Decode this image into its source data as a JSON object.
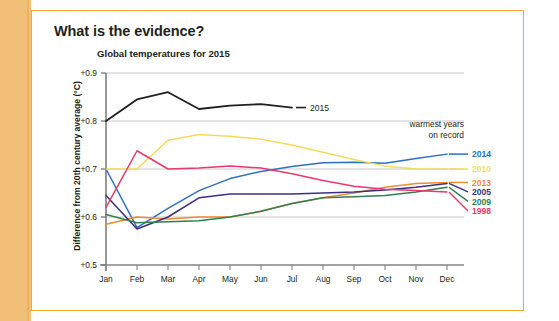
{
  "heading": "What is the evidence?",
  "chart_data": {
    "type": "line",
    "title": "Global temperatures for 2015",
    "xlabel": "",
    "ylabel": "Difference from 20th century average (°C)",
    "categories": [
      "Jan",
      "Feb",
      "Mar",
      "Apr",
      "May",
      "Jun",
      "Jul",
      "Aug",
      "Sep",
      "Oct",
      "Nov",
      "Dec"
    ],
    "ylim": [
      0.5,
      0.9
    ],
    "ytick_labels": [
      "+0.5",
      "+0.6",
      "+0.7",
      "+0.8",
      "+0.9"
    ],
    "ytick_values": [
      0.5,
      0.6,
      0.7,
      0.8,
      0.9
    ],
    "grid": "horizontal",
    "legend_position": "right",
    "legend_title_line1": "warmest years",
    "legend_title_line2": "on record",
    "annotation_2015": "2015",
    "series": [
      {
        "name": "2015",
        "color": "#231f20",
        "label": "2015",
        "in_legend": false,
        "values": [
          0.8,
          0.845,
          0.86,
          0.825,
          0.832,
          0.835,
          0.828,
          null,
          null,
          null,
          null,
          null
        ]
      },
      {
        "name": "2014",
        "color": "#2f6fc4",
        "label": "2014",
        "in_legend": true,
        "values": [
          0.7,
          0.578,
          0.618,
          0.655,
          0.68,
          0.695,
          0.705,
          0.713,
          0.714,
          0.712,
          0.722,
          0.731
        ]
      },
      {
        "name": "2010",
        "color": "#f2dc5a",
        "label": "2010",
        "in_legend": true,
        "values": [
          0.7,
          0.7,
          0.76,
          0.772,
          0.768,
          0.762,
          0.75,
          0.735,
          0.72,
          0.706,
          0.7,
          0.7
        ]
      },
      {
        "name": "2013",
        "color": "#ef8b33",
        "label": "2013",
        "in_legend": true,
        "values": [
          0.585,
          0.6,
          0.596,
          0.6,
          0.6,
          0.612,
          0.628,
          0.64,
          0.65,
          0.662,
          0.67,
          0.672
        ]
      },
      {
        "name": "2005",
        "color": "#3b3184",
        "label": "2005",
        "in_legend": true,
        "values": [
          0.645,
          0.575,
          0.6,
          0.64,
          0.648,
          0.648,
          0.648,
          0.65,
          0.652,
          0.656,
          0.662,
          0.67
        ]
      },
      {
        "name": "2009",
        "color": "#2f7f4f",
        "label": "2009",
        "in_legend": true,
        "values": [
          0.605,
          0.588,
          0.59,
          0.592,
          0.6,
          0.612,
          0.628,
          0.64,
          0.642,
          0.645,
          0.652,
          0.662
        ]
      },
      {
        "name": "1998",
        "color": "#e8396a",
        "label": "1998",
        "in_legend": true,
        "values": [
          0.62,
          0.738,
          0.7,
          0.702,
          0.706,
          0.702,
          0.69,
          0.676,
          0.664,
          0.658,
          0.655,
          0.652
        ]
      }
    ]
  }
}
